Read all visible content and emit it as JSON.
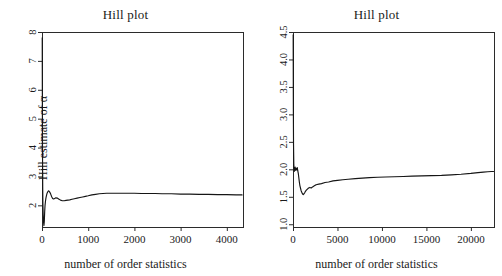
{
  "figure": {
    "width": 502,
    "height": 276,
    "background": "#ffffff",
    "foreground": "#1a1a1a",
    "panel_count": 2
  },
  "chart_data": [
    {
      "type": "line",
      "panel": "left",
      "title": "Hill plot",
      "xlabel": "number of order statistics",
      "ylabel": "Hill estimate of α",
      "xlim": [
        0,
        4350
      ],
      "ylim": [
        1.25,
        8.0
      ],
      "xticks": [
        0,
        1000,
        2000,
        3000,
        4000
      ],
      "xticklabels": [
        "0",
        "1000",
        "2000",
        "3000",
        "4000"
      ],
      "yticks": [
        2,
        3,
        4,
        5,
        6,
        7,
        8
      ],
      "yticklabels": [
        "2",
        "3",
        "4",
        "5",
        "6",
        "7",
        "8"
      ],
      "grid": false,
      "legend": null,
      "series": [
        {
          "name": "Hill estimate",
          "color": "#151515",
          "x": [
            5,
            8,
            12,
            16,
            20,
            25,
            30,
            36,
            42,
            50,
            58,
            66,
            75,
            85,
            95,
            110,
            125,
            140,
            155,
            170,
            190,
            210,
            230,
            250,
            275,
            300,
            330,
            360,
            400,
            440,
            480,
            520,
            560,
            600,
            650,
            700,
            760,
            820,
            880,
            940,
            1000,
            1080,
            1160,
            1240,
            1320,
            1400,
            1500,
            1600,
            1700,
            1800,
            1900,
            2000,
            2150,
            2300,
            2450,
            2600,
            2800,
            3000,
            3200,
            3400,
            3600,
            3800,
            4000,
            4200,
            4330
          ],
          "y": [
            7.8,
            5.3,
            3.55,
            2.55,
            2.05,
            1.72,
            1.52,
            1.38,
            1.3,
            1.45,
            1.78,
            2.0,
            2.14,
            2.25,
            2.33,
            2.42,
            2.47,
            2.5,
            2.49,
            2.45,
            2.38,
            2.3,
            2.24,
            2.22,
            2.24,
            2.26,
            2.25,
            2.22,
            2.18,
            2.16,
            2.16,
            2.17,
            2.18,
            2.19,
            2.21,
            2.23,
            2.25,
            2.27,
            2.29,
            2.31,
            2.33,
            2.36,
            2.38,
            2.4,
            2.41,
            2.42,
            2.42,
            2.42,
            2.42,
            2.42,
            2.42,
            2.42,
            2.41,
            2.41,
            2.41,
            2.4,
            2.4,
            2.39,
            2.39,
            2.38,
            2.38,
            2.37,
            2.37,
            2.36,
            2.36
          ]
        }
      ]
    },
    {
      "type": "line",
      "panel": "right",
      "title": "Hill plot",
      "xlabel": "number of order statistics",
      "ylabel": "Hill estimate of α",
      "xlim": [
        0,
        22600
      ],
      "ylim": [
        0.95,
        4.5
      ],
      "xticks": [
        0,
        5000,
        10000,
        15000,
        20000
      ],
      "xticklabels": [
        "0",
        "5000",
        "10000",
        "15000",
        "20000"
      ],
      "yticks": [
        1.0,
        1.5,
        2.0,
        2.5,
        3.0,
        3.5,
        4.0,
        4.5
      ],
      "yticklabels": [
        "1.0",
        "1.5",
        "2.0",
        "2.5",
        "3.0",
        "3.5",
        "4.0",
        "4.5"
      ],
      "grid": false,
      "legend": null,
      "series": [
        {
          "name": "Hill estimate",
          "color": "#151515",
          "x": [
            20,
            40,
            60,
            90,
            130,
            180,
            240,
            300,
            360,
            420,
            480,
            540,
            600,
            660,
            720,
            780,
            840,
            900,
            960,
            1020,
            1080,
            1150,
            1220,
            1300,
            1400,
            1500,
            1620,
            1750,
            1900,
            2050,
            2200,
            2400,
            2600,
            2900,
            3200,
            3600,
            4000,
            4500,
            5000,
            5600,
            6200,
            7000,
            7800,
            8600,
            9500,
            10400,
            11400,
            12400,
            13400,
            14500,
            15600,
            16700,
            17800,
            18900,
            20000,
            20800,
            21400,
            21900,
            22300,
            22550
          ],
          "y": [
            4.45,
            3.1,
            2.45,
            2.1,
            1.96,
            2.0,
            2.04,
            1.98,
            2.02,
            1.99,
            2.03,
            1.97,
            1.92,
            1.84,
            1.76,
            1.7,
            1.66,
            1.62,
            1.59,
            1.57,
            1.55,
            1.54,
            1.55,
            1.57,
            1.6,
            1.62,
            1.64,
            1.66,
            1.67,
            1.66,
            1.68,
            1.7,
            1.72,
            1.73,
            1.74,
            1.76,
            1.77,
            1.79,
            1.8,
            1.81,
            1.82,
            1.83,
            1.84,
            1.85,
            1.855,
            1.86,
            1.865,
            1.87,
            1.875,
            1.88,
            1.885,
            1.89,
            1.9,
            1.91,
            1.925,
            1.94,
            1.95,
            1.955,
            1.96,
            1.96
          ]
        }
      ]
    }
  ]
}
